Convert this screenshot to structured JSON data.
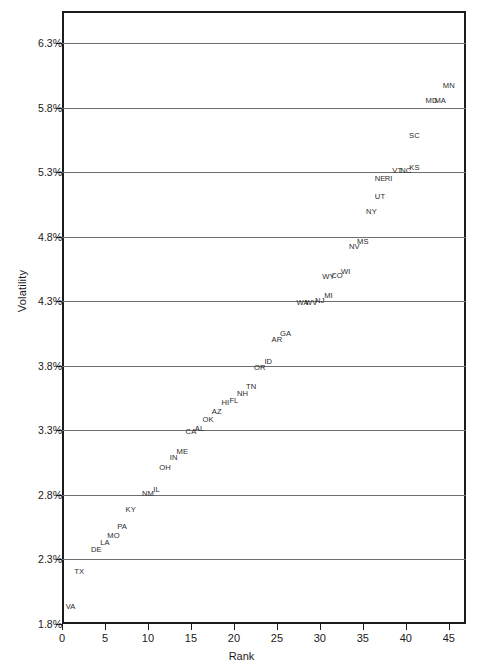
{
  "chart_data": {
    "type": "scatter",
    "title": "",
    "xlabel": "Rank",
    "ylabel": "Volatility",
    "xlim": [
      0,
      47
    ],
    "ylim": [
      1.8,
      6.55
    ],
    "grid": true,
    "legend": "none",
    "xticks": [
      0,
      5,
      10,
      15,
      20,
      25,
      30,
      35,
      40,
      45
    ],
    "xtick_labels": [
      "0",
      "5",
      "10",
      "15",
      "20",
      "25",
      "30",
      "35",
      "40",
      "45"
    ],
    "yticks": [
      1.8,
      2.3,
      2.8,
      3.3,
      3.8,
      4.3,
      4.8,
      5.3,
      5.8,
      6.3
    ],
    "ytick_labels": [
      "1.8%",
      "2.3%",
      "2.8%",
      "3.3%",
      "3.8%",
      "4.3%",
      "4.8%",
      "5.3%",
      "5.8%",
      "6.3%"
    ],
    "point_label_field": "state",
    "points": [
      {
        "state": "VA",
        "x": 1,
        "y": 1.93
      },
      {
        "state": "TX",
        "x": 2,
        "y": 2.2
      },
      {
        "state": "DE",
        "x": 4,
        "y": 2.37
      },
      {
        "state": "LA",
        "x": 5,
        "y": 2.43
      },
      {
        "state": "MO",
        "x": 6,
        "y": 2.48
      },
      {
        "state": "PA",
        "x": 7,
        "y": 2.55
      },
      {
        "state": "KY",
        "x": 8,
        "y": 2.68
      },
      {
        "state": "NM",
        "x": 10,
        "y": 2.81
      },
      {
        "state": "IL",
        "x": 11,
        "y": 2.84
      },
      {
        "state": "OH",
        "x": 12,
        "y": 3.01
      },
      {
        "state": "IN",
        "x": 13,
        "y": 3.09
      },
      {
        "state": "ME",
        "x": 14,
        "y": 3.13
      },
      {
        "state": "CA",
        "x": 15,
        "y": 3.29
      },
      {
        "state": "AL",
        "x": 16,
        "y": 3.31
      },
      {
        "state": "OK",
        "x": 17,
        "y": 3.38
      },
      {
        "state": "AZ",
        "x": 18,
        "y": 3.44
      },
      {
        "state": "HI",
        "x": 19,
        "y": 3.51
      },
      {
        "state": "FL",
        "x": 20,
        "y": 3.53
      },
      {
        "state": "NH",
        "x": 21,
        "y": 3.58
      },
      {
        "state": "TN",
        "x": 22,
        "y": 3.64
      },
      {
        "state": "OR",
        "x": 23,
        "y": 3.78
      },
      {
        "state": "ID",
        "x": 24,
        "y": 3.83
      },
      {
        "state": "AR",
        "x": 25,
        "y": 4.0
      },
      {
        "state": "GA",
        "x": 26,
        "y": 4.05
      },
      {
        "state": "WA",
        "x": 28,
        "y": 4.29
      },
      {
        "state": "WV",
        "x": 29,
        "y": 4.29
      },
      {
        "state": "NJ",
        "x": 30,
        "y": 4.3
      },
      {
        "state": "MI",
        "x": 31,
        "y": 4.34
      },
      {
        "state": "WY",
        "x": 31,
        "y": 4.49
      },
      {
        "state": "CO",
        "x": 32,
        "y": 4.5
      },
      {
        "state": "WI",
        "x": 33,
        "y": 4.53
      },
      {
        "state": "NV",
        "x": 34,
        "y": 4.72
      },
      {
        "state": "MS",
        "x": 35,
        "y": 4.76
      },
      {
        "state": "NY",
        "x": 36,
        "y": 4.99
      },
      {
        "state": "UT",
        "x": 37,
        "y": 5.11
      },
      {
        "state": "NE",
        "x": 37,
        "y": 5.25
      },
      {
        "state": "RI",
        "x": 38,
        "y": 5.25
      },
      {
        "state": "VT",
        "x": 39,
        "y": 5.31
      },
      {
        "state": "NC",
        "x": 40,
        "y": 5.31
      },
      {
        "state": "KS",
        "x": 41,
        "y": 5.33
      },
      {
        "state": "SC",
        "x": 41,
        "y": 5.58
      },
      {
        "state": "MD",
        "x": 43,
        "y": 5.85
      },
      {
        "state": "MA",
        "x": 44,
        "y": 5.85
      },
      {
        "state": "MN",
        "x": 45,
        "y": 5.97
      }
    ]
  }
}
